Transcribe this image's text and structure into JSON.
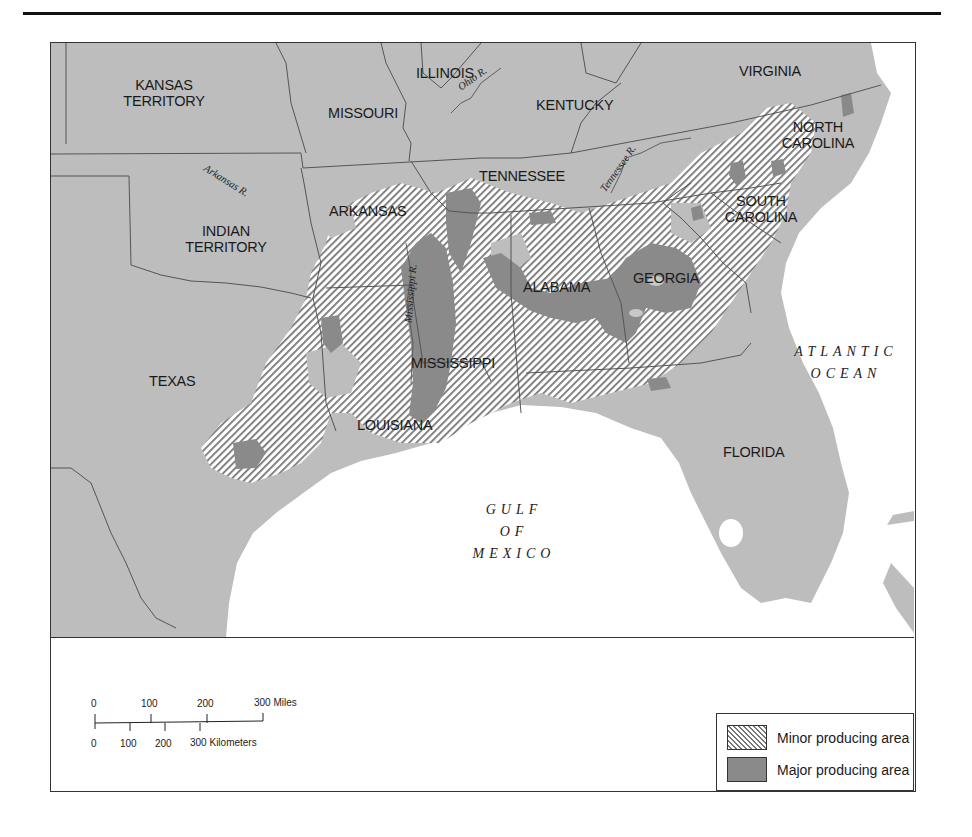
{
  "map": {
    "states": [
      {
        "id": "kansas-territory",
        "label": "KANSAS\nTERRITORY",
        "x": 95,
        "y": 34
      },
      {
        "id": "missouri",
        "label": "MISSOURI",
        "x": 277,
        "y": 62
      },
      {
        "id": "illinois",
        "label": "ILLINOIS",
        "x": 363,
        "y": 22
      },
      {
        "id": "kentucky",
        "label": "KENTUCKY",
        "x": 485,
        "y": 53
      },
      {
        "id": "virginia",
        "label": "VIRGINIA",
        "x": 688,
        "y": 20
      },
      {
        "id": "north-carolina",
        "label": "NORTH\nCAROLINA",
        "x": 743,
        "y": 78
      },
      {
        "id": "tennessee",
        "label": "TENNESSEE",
        "x": 429,
        "y": 125
      },
      {
        "id": "arkansas",
        "label": "ARKANSAS",
        "x": 278,
        "y": 160
      },
      {
        "id": "indian-territory",
        "label": "INDIAN\nTERRITORY",
        "x": 144,
        "y": 181
      },
      {
        "id": "south-carolina",
        "label": "SOUTH\nCAROLINA",
        "x": 678,
        "y": 151
      },
      {
        "id": "alabama",
        "label": "ALABAMA",
        "x": 472,
        "y": 236
      },
      {
        "id": "georgia",
        "label": "GEORGIA",
        "x": 582,
        "y": 227
      },
      {
        "id": "mississippi",
        "label": "MISSISSIPPI",
        "x": 360,
        "y": 311
      },
      {
        "id": "texas",
        "label": "TEXAS",
        "x": 98,
        "y": 330
      },
      {
        "id": "louisiana",
        "label": "LOUISIANA",
        "x": 306,
        "y": 374
      },
      {
        "id": "florida",
        "label": "FLORIDA",
        "x": 672,
        "y": 400
      }
    ],
    "rivers": [
      {
        "id": "ohio-river",
        "label": "Ohio R.",
        "x": 415,
        "y": 30,
        "rotate": -35
      },
      {
        "id": "arkansas-river",
        "label": "Arkansas R.",
        "x": 152,
        "y": 130,
        "rotate": 32
      },
      {
        "id": "tennessee-river",
        "label": "Tennessee R.",
        "x": 553,
        "y": 128,
        "rotate": -55
      },
      {
        "id": "mississippi-river",
        "label": "Mississippi R.",
        "x": 356,
        "y": 230,
        "rotate": -85
      }
    ],
    "water_bodies": [
      {
        "id": "atlantic-ocean",
        "label": "ATLANTIC\nOCEAN",
        "x": 720,
        "y": 298
      },
      {
        "id": "gulf-of-mexico",
        "label": "GULF\nOF\nMEXICO",
        "x": 425,
        "y": 458
      }
    ],
    "colors": {
      "land": "#bdbdbd",
      "major_area": "#8a8a8a",
      "minor_hatch": "#777777",
      "water": "#ffffff",
      "border": "#555555"
    }
  },
  "scale_bar": {
    "miles_ticks": [
      "0",
      "100",
      "200",
      "300 Miles"
    ],
    "km_ticks": [
      "0",
      "100",
      "200",
      "300 Kilometers"
    ]
  },
  "legend": {
    "items": [
      {
        "id": "minor",
        "label": "Minor producing area"
      },
      {
        "id": "major",
        "label": "Major producing area"
      }
    ]
  }
}
